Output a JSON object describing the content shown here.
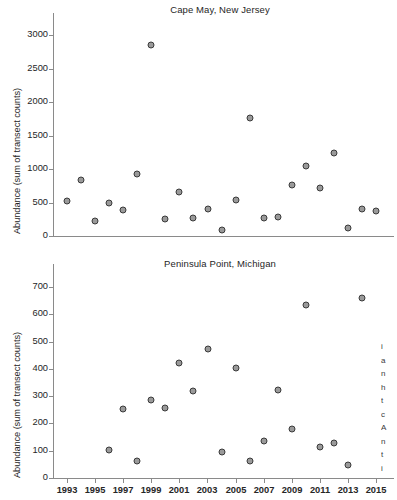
{
  "figure": {
    "width": 397,
    "height": 500,
    "marker_fill": "#9a9a9a",
    "marker_edge": "#3a3a3a",
    "axis_color": "#8a8a8a",
    "text_color": "#262626"
  },
  "shared_x": {
    "label": "",
    "tick_labels": [
      "1993",
      "1995",
      "1997",
      "1999",
      "2001",
      "2003",
      "2005",
      "2007",
      "2009",
      "2011",
      "2013",
      "2015"
    ],
    "tick_values": [
      1993,
      1995,
      1997,
      1999,
      2001,
      2003,
      2005,
      2007,
      2009,
      2011,
      2013,
      2015
    ],
    "xlim": [
      1992.0,
      2016.0
    ]
  },
  "edge_fragment": {
    "lines": [
      "i",
      "a",
      "n",
      "h",
      "t",
      "c",
      "A",
      "n",
      "t",
      "i"
    ]
  },
  "chart_data": [
    {
      "type": "scatter",
      "title": "Cape May, New Jersey",
      "xlabel": "",
      "ylabel": "Abundance (sum of transect counts)",
      "xlim": [
        1992.0,
        2016.0
      ],
      "ylim": [
        0,
        3150
      ],
      "grid": false,
      "legend": "none",
      "y_tick_labels": [
        "0",
        "500",
        "1000",
        "1500",
        "2000",
        "2500",
        "3000"
      ],
      "y_tick_values": [
        0,
        500,
        1000,
        1500,
        2000,
        2500,
        3000
      ],
      "x_tick_labels_visible": false,
      "x": [
        1993,
        1994,
        1995,
        1996,
        1997,
        1998,
        1999,
        2000,
        2001,
        2002,
        2003,
        2004,
        2005,
        2006,
        2007,
        2008,
        2009,
        2010,
        2011,
        2012,
        2013,
        2014,
        2015
      ],
      "y": [
        530,
        830,
        225,
        495,
        395,
        920,
        250,
        660,
        275,
        410,
        90,
        535,
        1765,
        275,
        290,
        765,
        1040,
        710,
        1245,
        125,
        410,
        375,
        null
      ],
      "points": [
        {
          "year": 1993,
          "value": 530
        },
        {
          "year": 1994,
          "value": 830
        },
        {
          "year": 1995,
          "value": 225
        },
        {
          "year": 1996,
          "value": 495
        },
        {
          "year": 1997,
          "value": 395
        },
        {
          "year": 1998,
          "value": 920
        },
        {
          "year": 1999,
          "value": 2850
        },
        {
          "year": 2000,
          "value": 250
        },
        {
          "year": 2001,
          "value": 660
        },
        {
          "year": 2002,
          "value": 275
        },
        {
          "year": 2003,
          "value": 410
        },
        {
          "year": 2004,
          "value": 90
        },
        {
          "year": 2005,
          "value": 535
        },
        {
          "year": 2006,
          "value": 1765
        },
        {
          "year": 2007,
          "value": 275
        },
        {
          "year": 2008,
          "value": 290
        },
        {
          "year": 2009,
          "value": 765
        },
        {
          "year": 2010,
          "value": 1040
        },
        {
          "year": 2011,
          "value": 710
        },
        {
          "year": 2012,
          "value": 1245
        },
        {
          "year": 2013,
          "value": 125
        },
        {
          "year": 2014,
          "value": 410
        },
        {
          "year": 2015,
          "value": 375
        }
      ]
    },
    {
      "type": "scatter",
      "title": "Peninsula Point, Michigan",
      "xlabel": "",
      "ylabel": "Abundance (sum of transect counts)",
      "xlim": [
        1992.0,
        2016.0
      ],
      "ylim": [
        0,
        740
      ],
      "grid": false,
      "legend": "none",
      "y_tick_labels": [
        "0",
        "100",
        "200",
        "300",
        "400",
        "500",
        "600",
        "700"
      ],
      "y_tick_values": [
        0,
        100,
        200,
        300,
        400,
        500,
        600,
        700
      ],
      "x_tick_labels_visible": true,
      "points": [
        {
          "year": 1996,
          "value": 102
        },
        {
          "year": 1997,
          "value": 252
        },
        {
          "year": 1998,
          "value": 62
        },
        {
          "year": 1999,
          "value": 286
        },
        {
          "year": 2000,
          "value": 258
        },
        {
          "year": 2001,
          "value": 422
        },
        {
          "year": 2002,
          "value": 320
        },
        {
          "year": 2003,
          "value": 472
        },
        {
          "year": 2004,
          "value": 97
        },
        {
          "year": 2005,
          "value": 404
        },
        {
          "year": 2006,
          "value": 61
        },
        {
          "year": 2007,
          "value": 134
        },
        {
          "year": 2008,
          "value": 324
        },
        {
          "year": 2009,
          "value": 181
        },
        {
          "year": 2010,
          "value": 635
        },
        {
          "year": 2011,
          "value": 114
        },
        {
          "year": 2012,
          "value": 129
        },
        {
          "year": 2013,
          "value": 47
        },
        {
          "year": 2014,
          "value": 658
        }
      ]
    }
  ]
}
